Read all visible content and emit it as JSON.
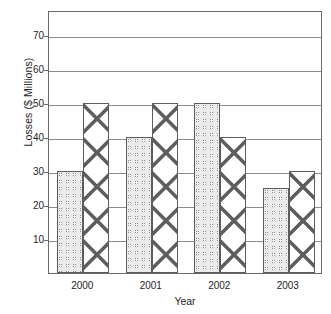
{
  "chart_data": {
    "type": "bar",
    "title": "",
    "xlabel": "Year",
    "ylabel": "Losses ($ Millions)",
    "categories": [
      "2000",
      "2001",
      "2002",
      "2003"
    ],
    "series": [
      {
        "name": "series-1",
        "pattern": "dots",
        "values": [
          30,
          40,
          50,
          25
        ]
      },
      {
        "name": "series-2",
        "pattern": "crosshatch",
        "values": [
          50,
          50,
          40,
          30
        ]
      }
    ],
    "ylim": [
      0,
      77.5
    ],
    "ytick_labels": [
      "10",
      "20",
      "30",
      "40",
      "50",
      "60",
      "70"
    ],
    "ytick_values": [
      10,
      20,
      30,
      40,
      50,
      60,
      70
    ],
    "grid": true,
    "legend": "none",
    "colors": {
      "axis": "#6a6a6a",
      "gridline": "#8d8d8d",
      "bar_outline": "#5c5c5c",
      "text": "#1e1e1e",
      "background": "#ffffff"
    }
  }
}
